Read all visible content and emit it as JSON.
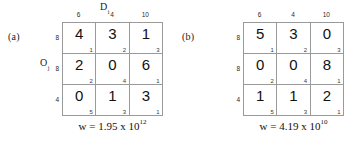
{
  "figure": {
    "background": "#ffffff",
    "grid_line_color": "#9a9a9a",
    "text_color": "#111111"
  },
  "panels": [
    {
      "id": "a",
      "label": "(a)",
      "axis_titles": {
        "columns": {
          "symbol": "D",
          "subscript": "i"
        },
        "rows": {
          "symbol": "O",
          "subscript": "j"
        }
      },
      "column_labels": [
        "6",
        "4",
        "10"
      ],
      "row_labels": [
        "8",
        "8",
        "4"
      ],
      "cells": [
        [
          {
            "value": "4",
            "cost": "1"
          },
          {
            "value": "3",
            "cost": "2"
          },
          {
            "value": "1",
            "cost": "3"
          }
        ],
        [
          {
            "value": "2",
            "cost": "2"
          },
          {
            "value": "0",
            "cost": "4"
          },
          {
            "value": "6",
            "cost": "1"
          }
        ],
        [
          {
            "value": "0",
            "cost": "5"
          },
          {
            "value": "1",
            "cost": "3"
          },
          {
            "value": "3",
            "cost": "1"
          }
        ]
      ],
      "caption": {
        "prefix": "w = 1.95 x 10",
        "exponent": "12"
      }
    },
    {
      "id": "b",
      "label": "(b)",
      "axis_titles": {
        "columns": {
          "symbol": "",
          "subscript": ""
        },
        "rows": {
          "symbol": "",
          "subscript": ""
        }
      },
      "column_labels": [
        "6",
        "4",
        "10"
      ],
      "row_labels": [
        "8",
        "8",
        "4"
      ],
      "cells": [
        [
          {
            "value": "5",
            "cost": "1"
          },
          {
            "value": "3",
            "cost": "2"
          },
          {
            "value": "0",
            "cost": "3"
          }
        ],
        [
          {
            "value": "0",
            "cost": "2"
          },
          {
            "value": "0",
            "cost": "4"
          },
          {
            "value": "8",
            "cost": "1"
          }
        ],
        [
          {
            "value": "1",
            "cost": "5"
          },
          {
            "value": "1",
            "cost": "3"
          },
          {
            "value": "2",
            "cost": "1"
          }
        ]
      ],
      "caption": {
        "prefix": "w = 4.19 x 10",
        "exponent": "10"
      }
    }
  ]
}
